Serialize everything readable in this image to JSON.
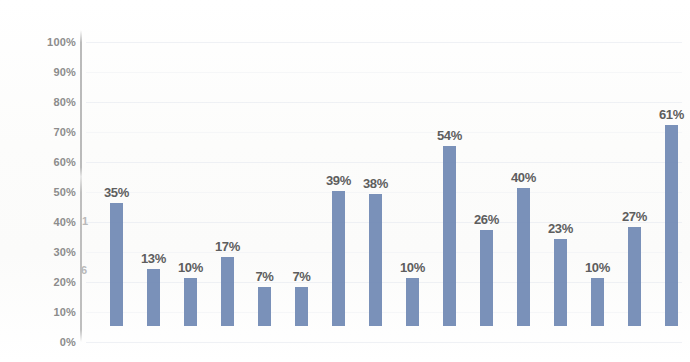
{
  "chart_data": {
    "type": "bar",
    "title": "",
    "subtitle": "",
    "xlabel": "",
    "ylabel": "",
    "ylim": [
      0,
      100
    ],
    "grid": true,
    "legend": "none",
    "bar_color": "#7089b4",
    "label_color": "#5e5e5e",
    "axis_label_color": "#8c8c8c",
    "value_suffix": "%",
    "ytick_labels": [
      "100%",
      "90%",
      "80%",
      "70%",
      "60%",
      "50%",
      "40%",
      "30%",
      "20%",
      "10%",
      "0%"
    ],
    "ytick_values": [
      100,
      90,
      80,
      70,
      60,
      50,
      40,
      30,
      20,
      10,
      0
    ],
    "categories": [
      "1",
      "2",
      "3",
      "4",
      "5",
      "6",
      "7",
      "8",
      "9",
      "10",
      "11",
      "12",
      "13",
      "14",
      "15",
      "16"
    ],
    "values": [
      35,
      13,
      10,
      17,
      7,
      7,
      39,
      38,
      10,
      54,
      26,
      40,
      23,
      10,
      27,
      61
    ],
    "data_labels": [
      "35%",
      "13%",
      "10%",
      "17%",
      "7%",
      "7%",
      "39%",
      "38%",
      "10%",
      "54%",
      "26%",
      "40%",
      "23%",
      "10%",
      "27%",
      "61%"
    ]
  },
  "artifacts": {
    "mark_upper": "1",
    "mark_lower": "6"
  }
}
